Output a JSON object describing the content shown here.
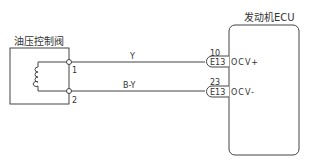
{
  "diagram": {
    "left_component": {
      "label": "油压控制阀",
      "pins": [
        {
          "number": "1"
        },
        {
          "number": "2"
        }
      ]
    },
    "right_component": {
      "label": "发动机ECU"
    },
    "wires": [
      {
        "color_code": "Y",
        "connector": "E13",
        "pin": "10",
        "signal": "OCV+"
      },
      {
        "color_code": "B-Y",
        "connector": "E13",
        "pin": "23",
        "signal": "OCV-"
      }
    ],
    "colors": {
      "line": "#444444",
      "background": "#ffffff"
    }
  }
}
